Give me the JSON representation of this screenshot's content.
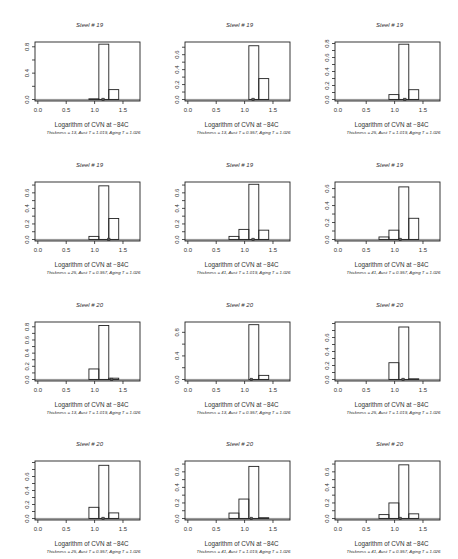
{
  "chart_data": [
    {
      "type": "bar",
      "title": "Steel # 19",
      "xlabel": "Logarithm of CVN at −84C",
      "subtitle": "Thickness = 13, Aust T = 1.019, Aging T = 1.026",
      "xlim": [
        -0.05,
        1.8
      ],
      "ylim": [
        0,
        0.85
      ],
      "xticks": [
        "0.0",
        "0.5",
        "1.0",
        "1.5"
      ],
      "yticks": [
        "0.0",
        "0.4",
        "0.8"
      ],
      "bins": [
        {
          "x0": 0.9,
          "x1": 1.075,
          "v": 0.01
        },
        {
          "x0": 1.075,
          "x1": 1.25,
          "v": 0.84
        },
        {
          "x0": 1.25,
          "x1": 1.425,
          "v": 0.15
        }
      ],
      "marker_x": 1.15
    },
    {
      "type": "bar",
      "title": "Steel # 19",
      "xlabel": "Logarithm of CVN at −84C",
      "subtitle": "Thickness = 13, Aust T = 0.957, Aging T = 1.026",
      "xlim": [
        -0.05,
        1.8
      ],
      "ylim": [
        0,
        0.75
      ],
      "xticks": [
        "0.0",
        "0.5",
        "1.0",
        "1.5"
      ],
      "yticks": [
        "0.0",
        "0.2",
        "0.4",
        "0.6"
      ],
      "bins": [
        {
          "x0": 1.075,
          "x1": 1.25,
          "v": 0.72
        },
        {
          "x0": 1.25,
          "x1": 1.425,
          "v": 0.28
        }
      ],
      "marker_x": 1.15
    },
    {
      "type": "bar",
      "title": "Steel # 19",
      "xlabel": "Logarithm of CVN at −84C",
      "subtitle": "Thickness = 25, Aust T = 1.019, Aging T = 1.026",
      "xlim": [
        -0.05,
        1.8
      ],
      "ylim": [
        0,
        0.8
      ],
      "xticks": [
        "0.0",
        "0.5",
        "1.0",
        "1.5"
      ],
      "yticks": [
        "0.0",
        "0.2",
        "0.4",
        "0.6",
        "0.8"
      ],
      "bins": [
        {
          "x0": 0.9,
          "x1": 1.075,
          "v": 0.07
        },
        {
          "x0": 1.075,
          "x1": 1.25,
          "v": 0.79
        },
        {
          "x0": 1.25,
          "x1": 1.425,
          "v": 0.14
        }
      ],
      "marker_x": 1.18
    },
    {
      "type": "bar",
      "title": "Steel # 19",
      "xlabel": "Logarithm of CVN at −84C",
      "subtitle": "Thickness = 25, Aust T = 0.957, Aging T = 1.026",
      "xlim": [
        -0.05,
        1.8
      ],
      "ylim": [
        0,
        0.72
      ],
      "xticks": [
        "0.0",
        "0.5",
        "1.0",
        "1.5"
      ],
      "yticks": [
        "0.0",
        "0.2",
        "0.4",
        "0.6"
      ],
      "bins": [
        {
          "x0": 0.9,
          "x1": 1.075,
          "v": 0.04
        },
        {
          "x0": 1.075,
          "x1": 1.25,
          "v": 0.69
        },
        {
          "x0": 1.25,
          "x1": 1.425,
          "v": 0.27
        }
      ],
      "marker_x": 1.25
    },
    {
      "type": "bar",
      "title": "Steel # 19",
      "xlabel": "Logarithm of CVN at −84C",
      "subtitle": "Thickness = 41, Aust T = 1.019, Aging T = 1.026",
      "xlim": [
        -0.05,
        1.8
      ],
      "ylim": [
        0,
        0.72
      ],
      "xticks": [
        "0.0",
        "0.5",
        "1.0",
        "1.5"
      ],
      "yticks": [
        "0.0",
        "0.2",
        "0.4",
        "0.6"
      ],
      "bins": [
        {
          "x0": 0.725,
          "x1": 0.9,
          "v": 0.04
        },
        {
          "x0": 0.9,
          "x1": 1.075,
          "v": 0.13
        },
        {
          "x0": 1.075,
          "x1": 1.25,
          "v": 0.71
        },
        {
          "x0": 1.25,
          "x1": 1.425,
          "v": 0.12
        }
      ],
      "marker_x": 1.15
    },
    {
      "type": "bar",
      "title": "Steel # 19",
      "xlabel": "Logarithm of CVN at −84C",
      "subtitle": "Thickness = 41, Aust T = 0.957, Aging T = 1.026",
      "xlim": [
        -0.05,
        1.8
      ],
      "ylim": [
        0,
        0.66
      ],
      "xticks": [
        "0.0",
        "0.5",
        "1.0",
        "1.5"
      ],
      "yticks": [
        "0.0",
        "0.2",
        "0.4",
        "0.6"
      ],
      "bins": [
        {
          "x0": 0.725,
          "x1": 0.9,
          "v": 0.03
        },
        {
          "x0": 0.9,
          "x1": 1.075,
          "v": 0.11
        },
        {
          "x0": 1.075,
          "x1": 1.25,
          "v": 0.62
        },
        {
          "x0": 1.25,
          "x1": 1.425,
          "v": 0.25
        }
      ],
      "marker_x": 1.1
    },
    {
      "type": "bar",
      "title": "Steel # 20",
      "xlabel": "Logarithm of CVN at −84C",
      "subtitle": "Thickness = 13, Aust T = 1.019, Aging T = 1.026",
      "xlim": [
        -0.05,
        1.8
      ],
      "ylim": [
        0,
        0.85
      ],
      "xticks": [
        "0.0",
        "0.5",
        "1.0",
        "1.5"
      ],
      "yticks": [
        "0.0",
        "0.2",
        "0.4",
        "0.6",
        "0.8"
      ],
      "bins": [
        {
          "x0": 0.9,
          "x1": 1.075,
          "v": 0.16
        },
        {
          "x0": 1.075,
          "x1": 1.25,
          "v": 0.82
        },
        {
          "x0": 1.25,
          "x1": 1.425,
          "v": 0.02
        }
      ],
      "marker_x": 1.3
    },
    {
      "type": "bar",
      "title": "Steel # 20",
      "xlabel": "Logarithm of CVN at −84C",
      "subtitle": "Thickness = 13, Aust T = 0.957, Aging T = 1.026",
      "xlim": [
        -0.05,
        1.8
      ],
      "ylim": [
        0,
        0.95
      ],
      "xticks": [
        "0.0",
        "0.5",
        "1.0",
        "1.5"
      ],
      "yticks": [
        "0.0",
        "0.4",
        "0.8"
      ],
      "bins": [
        {
          "x0": 1.075,
          "x1": 1.25,
          "v": 0.93
        },
        {
          "x0": 1.25,
          "x1": 1.425,
          "v": 0.07
        }
      ],
      "marker_x": 1.12
    },
    {
      "type": "bar",
      "title": "Steel # 20",
      "xlabel": "Logarithm of CVN at −84C",
      "subtitle": "Thickness = 25, Aust T = 1.019, Aging T = 1.026",
      "xlim": [
        -0.05,
        1.8
      ],
      "ylim": [
        0,
        0.8
      ],
      "xticks": [
        "0.0",
        "0.5",
        "1.0",
        "1.5"
      ],
      "yticks": [
        "0.0",
        "0.2",
        "0.4",
        "0.6"
      ],
      "bins": [
        {
          "x0": 0.9,
          "x1": 1.075,
          "v": 0.24
        },
        {
          "x0": 1.075,
          "x1": 1.25,
          "v": 0.75
        },
        {
          "x0": 1.25,
          "x1": 1.425,
          "v": 0.01
        }
      ],
      "marker_x": 1.15
    },
    {
      "type": "bar",
      "title": "Steel # 20",
      "xlabel": "Logarithm of CVN at −84C",
      "subtitle": "Thickness = 25, Aust T = 0.957, Aging T = 1.026",
      "xlim": [
        -0.05,
        1.8
      ],
      "ylim": [
        0,
        0.8
      ],
      "xticks": [
        "0.0",
        "0.5",
        "1.0",
        "1.5"
      ],
      "yticks": [
        "0.0",
        "0.2",
        "0.4",
        "0.6"
      ],
      "bins": [
        {
          "x0": 0.9,
          "x1": 1.075,
          "v": 0.16
        },
        {
          "x0": 1.075,
          "x1": 1.25,
          "v": 0.76
        },
        {
          "x0": 1.25,
          "x1": 1.425,
          "v": 0.08
        }
      ],
      "marker_x": 1.15
    },
    {
      "type": "bar",
      "title": "Steel # 20",
      "xlabel": "Logarithm of CVN at −84C",
      "subtitle": "Thickness = 41, Aust T = 1.019, Aging T = 1.026",
      "xlim": [
        -0.05,
        1.8
      ],
      "ylim": [
        0,
        0.72
      ],
      "xticks": [
        "0.0",
        "0.5",
        "1.0",
        "1.5"
      ],
      "yticks": [
        "0.0",
        "0.2",
        "0.4",
        "0.6"
      ],
      "bins": [
        {
          "x0": 0.725,
          "x1": 0.9,
          "v": 0.07
        },
        {
          "x0": 0.9,
          "x1": 1.075,
          "v": 0.25
        },
        {
          "x0": 1.075,
          "x1": 1.25,
          "v": 0.67
        },
        {
          "x0": 1.25,
          "x1": 1.425,
          "v": 0.01
        }
      ],
      "marker_x": 1.12
    },
    {
      "type": "bar",
      "title": "Steel # 20",
      "xlabel": "Logarithm of CVN at −84C",
      "subtitle": "Thickness = 41, Aust T = 0.957, Aging T = 1.026",
      "xlim": [
        -0.05,
        1.8
      ],
      "ylim": [
        0,
        0.72
      ],
      "xticks": [
        "0.0",
        "0.5",
        "1.0",
        "1.5"
      ],
      "yticks": [
        "0.0",
        "0.2",
        "0.4",
        "0.6"
      ],
      "bins": [
        {
          "x0": 0.725,
          "x1": 0.9,
          "v": 0.05
        },
        {
          "x0": 0.9,
          "x1": 1.075,
          "v": 0.2
        },
        {
          "x0": 1.075,
          "x1": 1.25,
          "v": 0.69
        },
        {
          "x0": 1.25,
          "x1": 1.425,
          "v": 0.06
        }
      ],
      "marker_x": 1.1
    }
  ]
}
